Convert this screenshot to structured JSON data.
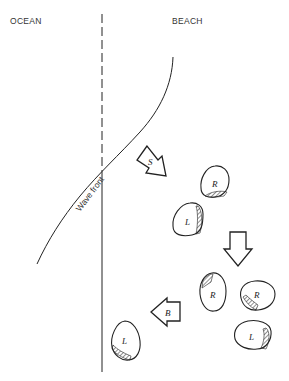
{
  "labels": {
    "ocean": "OCEAN",
    "beach": "BEACH",
    "wave_front": "Wave front"
  },
  "arrows": [
    {
      "id": "swash",
      "label": "S",
      "direction": "down-right"
    },
    {
      "id": "transition",
      "label": "",
      "direction": "down"
    },
    {
      "id": "backwash",
      "label": "B",
      "direction": "left"
    }
  ],
  "stones": [
    {
      "id": "stone-1",
      "label": "R",
      "hatch_side": "bottom"
    },
    {
      "id": "stone-2",
      "label": "L",
      "hatch_side": "right"
    },
    {
      "id": "stone-3",
      "label": "R",
      "hatch_side": "top-left"
    },
    {
      "id": "stone-4",
      "label": "R",
      "hatch_side": "bottom-left"
    },
    {
      "id": "stone-5",
      "label": "L",
      "hatch_side": "right"
    },
    {
      "id": "stone-6",
      "label": "L",
      "hatch_side": "bottom-left"
    }
  ],
  "colors": {
    "ink": "#222222",
    "background": "#ffffff"
  }
}
